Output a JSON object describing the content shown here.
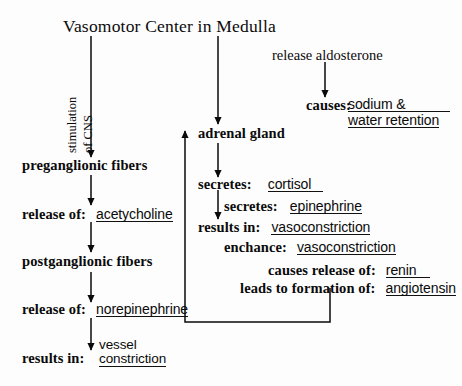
{
  "diagram": {
    "title": "Vasomotor Center in Medulla",
    "rotated_labels": [
      {
        "text": "stimulation"
      },
      {
        "text": "of CNS"
      }
    ],
    "left_branch": [
      {
        "label": "preganglionic fibers",
        "value": "",
        "underlined": false
      },
      {
        "label": "release of:",
        "value": "acetycholine",
        "underlined": true
      },
      {
        "label": "postganglionic fibers",
        "value": "",
        "underlined": false
      },
      {
        "label": "release of:",
        "value": "norepinephrine",
        "underlined": true
      },
      {
        "label": "results in:",
        "value_line1": "vessel",
        "value_line2": "constriction",
        "underlined": true
      }
    ],
    "middle_branch": [
      {
        "label": "adrenal gland",
        "value": "",
        "underlined": false
      },
      {
        "label": "secretes:",
        "value": "cortisol",
        "underlined": true
      },
      {
        "label": "secretes:",
        "value": "epinephrine",
        "underlined": true
      },
      {
        "label": "results in:",
        "value": "vasoconstriction",
        "underlined": true
      },
      {
        "label": "enchance:",
        "value": "vasoconstriction",
        "underlined": true
      }
    ],
    "right_branch": [
      {
        "label": "release aldosterone",
        "value": "",
        "underlined": false
      },
      {
        "label": "causes:",
        "value_line1": "sodium &",
        "value_line2": "water retention",
        "underlined": true
      }
    ],
    "feedback_rows": [
      {
        "label": "causes release of:",
        "value": "renin",
        "underlined": true
      },
      {
        "label": "leads to formation of:",
        "value": "angiotensin",
        "underlined": true
      }
    ],
    "colors": {
      "ink": "#0a0a0a",
      "rule": "#111111",
      "background": "#fdfdfd"
    }
  }
}
